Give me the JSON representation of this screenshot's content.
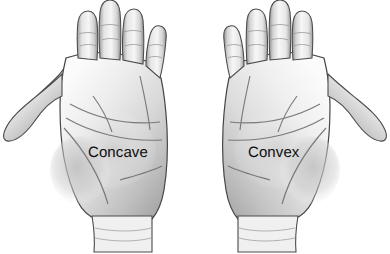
{
  "figure": {
    "background_color": "#ffffff",
    "width": 390,
    "height": 254,
    "style": "grayscale pencil-shaded photographic illustration"
  },
  "hands": [
    {
      "id": "concave",
      "label": "Concave",
      "side": "left",
      "view": "palm",
      "thumb_direction": "left",
      "label_color": "#0d0d0d",
      "skin_light": "#f2f2f2",
      "skin_mid": "#cfcfcf",
      "skin_shadow": "#8c8c8c",
      "outline_color": "#3a3a3a"
    },
    {
      "id": "convex",
      "label": "Convex",
      "side": "right",
      "view": "palm",
      "thumb_direction": "right",
      "label_color": "#0d0d0d",
      "skin_light": "#f4f4f4",
      "skin_mid": "#d4d4d4",
      "skin_shadow": "#909090",
      "outline_color": "#3a3a3a"
    }
  ]
}
